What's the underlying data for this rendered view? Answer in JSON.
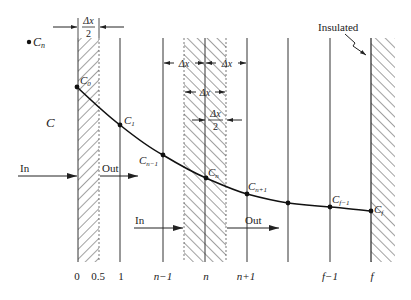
{
  "diagram": {
    "colors": {
      "ink": "#222222",
      "line": "#333333",
      "background": "#ffffff"
    },
    "legend_point": {
      "label": "C",
      "subscript": "n"
    },
    "concentration_label": "C",
    "insulated_label": "Insulated",
    "dimension_labels": {
      "half_left_num": "Δx",
      "half_left_den": "2",
      "dx_left": "Δx",
      "dx_right": "Δx",
      "dx_mid": "Δx",
      "half_mid_num": "Δx",
      "half_mid_den": "2"
    },
    "flow_labels": {
      "in_left": "In",
      "out_left": "Out",
      "in_mid": "In",
      "out_mid": "Out"
    },
    "node_labels": [
      {
        "base": "C",
        "sub": "0"
      },
      {
        "base": "C",
        "sub": "1"
      },
      {
        "base": "C",
        "sub": "n−1"
      },
      {
        "base": "C",
        "sub": "n"
      },
      {
        "base": "C",
        "sub": "n+1"
      },
      {
        "base": "C",
        "sub": "f−1"
      },
      {
        "base": "C",
        "sub": "f"
      }
    ],
    "axis_ticks": [
      "0",
      "0.5",
      "1",
      "n−1",
      "n",
      "n+1",
      "f−1",
      "f"
    ],
    "curve_points": [
      [
        77,
        87
      ],
      [
        120,
        125
      ],
      [
        163,
        155
      ],
      [
        206,
        178
      ],
      [
        247,
        194
      ],
      [
        288,
        203
      ],
      [
        330,
        207
      ],
      [
        371,
        211
      ]
    ]
  }
}
